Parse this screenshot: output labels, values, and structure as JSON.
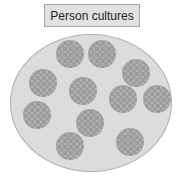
{
  "title": "Person cultures",
  "colors": {
    "label_bg": "#e2e2e2",
    "dish": "#dcdcdc",
    "colony": "#9c9c9c"
  },
  "colonies": [
    {
      "x": 70,
      "y": 54
    },
    {
      "x": 102,
      "y": 54
    },
    {
      "x": 136,
      "y": 73
    },
    {
      "x": 43,
      "y": 83
    },
    {
      "x": 83,
      "y": 91
    },
    {
      "x": 123,
      "y": 99
    },
    {
      "x": 157,
      "y": 99
    },
    {
      "x": 37,
      "y": 115
    },
    {
      "x": 90,
      "y": 123
    },
    {
      "x": 70,
      "y": 146
    },
    {
      "x": 130,
      "y": 142
    }
  ],
  "colony_radius": 14
}
